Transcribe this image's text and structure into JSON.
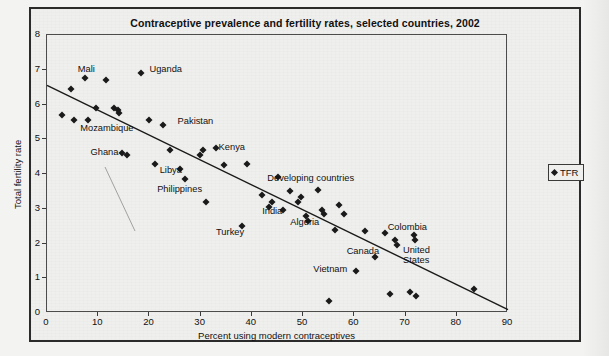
{
  "chart_data": {
    "type": "scatter",
    "title": "Contraceptive prevalence and fertility rates, selected countries, 2002",
    "xlabel": "Percent using modern contraceptives",
    "ylabel": "Total fertility rate",
    "xlim": [
      0,
      90
    ],
    "ylim": [
      0,
      8
    ],
    "xticks": [
      "0",
      "10",
      "20",
      "30",
      "40",
      "50",
      "60",
      "70",
      "80",
      "90"
    ],
    "yticks": [
      "0",
      "1",
      "2",
      "3",
      "4",
      "5",
      "6",
      "7",
      "8"
    ],
    "grid": false,
    "legend": {
      "position": "right-outside",
      "entries": [
        {
          "label": "TFR",
          "marker": "diamond",
          "color": "#1a1a1a"
        }
      ]
    },
    "trendline": {
      "type": "linear",
      "x_start": 0,
      "y_start": 6.55,
      "x_end": 90,
      "y_end": 0.1
    },
    "series": [
      {
        "name": "TFR",
        "marker": "diamond",
        "color": "#1a1a1a",
        "points": [
          {
            "x": 3.0,
            "y": 5.7
          },
          {
            "x": 4.6,
            "y": 6.45
          },
          {
            "x": 5.2,
            "y": 5.55
          },
          {
            "x": 7.5,
            "y": 6.75
          },
          {
            "x": 8.0,
            "y": 5.55
          },
          {
            "x": 9.6,
            "y": 5.9
          },
          {
            "x": 11.6,
            "y": 6.7
          },
          {
            "x": 13.0,
            "y": 5.9
          },
          {
            "x": 13.8,
            "y": 5.85
          },
          {
            "x": 14.0,
            "y": 5.75
          },
          {
            "x": 14.6,
            "y": 4.6
          },
          {
            "x": 15.6,
            "y": 4.55
          },
          {
            "x": 18.4,
            "y": 6.9
          },
          {
            "x": 20.0,
            "y": 5.55
          },
          {
            "x": 21.0,
            "y": 4.3
          },
          {
            "x": 22.6,
            "y": 5.4
          },
          {
            "x": 24.0,
            "y": 4.7
          },
          {
            "x": 26.0,
            "y": 4.15
          },
          {
            "x": 27.0,
            "y": 3.85
          },
          {
            "x": 29.8,
            "y": 4.55
          },
          {
            "x": 30.4,
            "y": 4.7
          },
          {
            "x": 31.0,
            "y": 3.2
          },
          {
            "x": 33.0,
            "y": 4.75
          },
          {
            "x": 34.6,
            "y": 4.25
          },
          {
            "x": 38.0,
            "y": 2.5
          },
          {
            "x": 39.0,
            "y": 4.3
          },
          {
            "x": 42.0,
            "y": 3.4
          },
          {
            "x": 43.4,
            "y": 3.05
          },
          {
            "x": 44.0,
            "y": 3.2
          },
          {
            "x": 45.0,
            "y": 3.9
          },
          {
            "x": 46.0,
            "y": 2.95
          },
          {
            "x": 47.5,
            "y": 3.5
          },
          {
            "x": 49.0,
            "y": 3.2
          },
          {
            "x": 49.6,
            "y": 3.35
          },
          {
            "x": 50.6,
            "y": 2.8
          },
          {
            "x": 51.0,
            "y": 2.65
          },
          {
            "x": 53.0,
            "y": 3.55
          },
          {
            "x": 53.6,
            "y": 2.95
          },
          {
            "x": 54.0,
            "y": 2.85
          },
          {
            "x": 55.0,
            "y": 0.35
          },
          {
            "x": 56.2,
            "y": 2.4
          },
          {
            "x": 57.0,
            "y": 3.1
          },
          {
            "x": 58.0,
            "y": 2.85
          },
          {
            "x": 60.4,
            "y": 1.2
          },
          {
            "x": 62.0,
            "y": 2.35
          },
          {
            "x": 64.0,
            "y": 1.6
          },
          {
            "x": 66.0,
            "y": 2.3
          },
          {
            "x": 67.0,
            "y": 0.55
          },
          {
            "x": 68.0,
            "y": 2.1
          },
          {
            "x": 68.4,
            "y": 1.95
          },
          {
            "x": 70.8,
            "y": 0.6
          },
          {
            "x": 71.6,
            "y": 2.25
          },
          {
            "x": 71.8,
            "y": 2.1
          },
          {
            "x": 72.0,
            "y": 0.5
          },
          {
            "x": 83.4,
            "y": 0.7
          }
        ]
      }
    ],
    "annotations": [
      {
        "label": "Mali",
        "x": 6.0,
        "y": 7.0
      },
      {
        "label": "Uganda",
        "x": 20.0,
        "y": 7.0
      },
      {
        "label": "Mozambique",
        "x": 6.5,
        "y": 5.3
      },
      {
        "label": "Pakistan",
        "x": 25.5,
        "y": 5.5
      },
      {
        "label": "Ghana",
        "x": 8.5,
        "y": 4.6
      },
      {
        "label": "Kenya",
        "x": 33.5,
        "y": 4.75
      },
      {
        "label": "Libya",
        "x": 22.0,
        "y": 4.1
      },
      {
        "label": "Philippines",
        "x": 21.5,
        "y": 3.55
      },
      {
        "label": "Developing countries",
        "x": 43.0,
        "y": 3.85
      },
      {
        "label": "India",
        "x": 42.0,
        "y": 2.9
      },
      {
        "label": "Algeria",
        "x": 47.5,
        "y": 2.6
      },
      {
        "label": "Turkey",
        "x": 33.0,
        "y": 2.3
      },
      {
        "label": "Colombia",
        "x": 66.5,
        "y": 2.45
      },
      {
        "label": "Canada",
        "x": 58.5,
        "y": 1.75
      },
      {
        "label": "United\nStates",
        "x": 69.5,
        "y": 1.75
      },
      {
        "label": "Vietnam",
        "x": 52.0,
        "y": 1.25
      }
    ]
  },
  "legend_panel": {
    "label": "TFR"
  }
}
